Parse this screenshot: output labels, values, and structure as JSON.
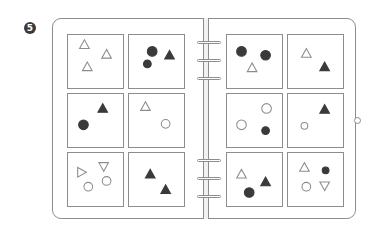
{
  "figure": {
    "number": "5",
    "stroke_color": "#8d8d8d",
    "fill_color": "#3a3a3a"
  },
  "spine_rings_y": [
    42,
    60,
    78,
    160,
    178,
    196
  ],
  "panels": [
    {
      "id": "L1",
      "x": 67,
      "y": 34,
      "shapes": [
        {
          "type": "triangle-up",
          "fill": false,
          "cx": 17,
          "cy": 10,
          "r": 5
        },
        {
          "type": "triangle-up",
          "fill": false,
          "cx": 40,
          "cy": 20,
          "r": 5
        },
        {
          "type": "triangle-up",
          "fill": false,
          "cx": 20,
          "cy": 33,
          "r": 5
        }
      ]
    },
    {
      "id": "L2",
      "x": 128,
      "y": 34,
      "shapes": [
        {
          "type": "circle",
          "fill": true,
          "cx": 24,
          "cy": 17,
          "r": 5
        },
        {
          "type": "circle",
          "fill": true,
          "cx": 19,
          "cy": 30,
          "r": 4
        },
        {
          "type": "triangle-up",
          "fill": true,
          "cx": 42,
          "cy": 21,
          "r": 5
        }
      ]
    },
    {
      "id": "L3",
      "x": 67,
      "y": 93,
      "shapes": [
        {
          "type": "triangle-up",
          "fill": true,
          "cx": 36,
          "cy": 15,
          "r": 5
        },
        {
          "type": "circle",
          "fill": true,
          "cx": 16,
          "cy": 32,
          "r": 5
        }
      ]
    },
    {
      "id": "L4",
      "x": 128,
      "y": 93,
      "shapes": [
        {
          "type": "triangle-up",
          "fill": false,
          "cx": 17,
          "cy": 13,
          "r": 5
        },
        {
          "type": "circle",
          "fill": false,
          "cx": 38,
          "cy": 31,
          "r": 4.5
        }
      ]
    },
    {
      "id": "L5",
      "x": 67,
      "y": 152,
      "shapes": [
        {
          "type": "triangle-right",
          "fill": false,
          "cx": 14,
          "cy": 20,
          "r": 5
        },
        {
          "type": "triangle-down",
          "fill": false,
          "cx": 37,
          "cy": 14,
          "r": 5
        },
        {
          "type": "circle",
          "fill": false,
          "cx": 40,
          "cy": 29,
          "r": 4.5
        },
        {
          "type": "circle",
          "fill": false,
          "cx": 21,
          "cy": 35,
          "r": 4.5
        }
      ]
    },
    {
      "id": "L6",
      "x": 128,
      "y": 152,
      "shapes": [
        {
          "type": "triangle-up",
          "fill": true,
          "cx": 22,
          "cy": 22,
          "r": 5
        },
        {
          "type": "triangle-up",
          "fill": true,
          "cx": 38,
          "cy": 38,
          "r": 5
        }
      ]
    },
    {
      "id": "R1",
      "x": 226,
      "y": 34,
      "shapes": [
        {
          "type": "circle",
          "fill": true,
          "cx": 15,
          "cy": 17,
          "r": 5
        },
        {
          "type": "circle",
          "fill": true,
          "cx": 40,
          "cy": 21,
          "r": 5
        },
        {
          "type": "triangle-up",
          "fill": false,
          "cx": 26,
          "cy": 34,
          "r": 5
        }
      ]
    },
    {
      "id": "R2",
      "x": 287,
      "y": 34,
      "shapes": [
        {
          "type": "triangle-up",
          "fill": false,
          "cx": 19,
          "cy": 19,
          "r": 5
        },
        {
          "type": "triangle-up",
          "fill": true,
          "cx": 38,
          "cy": 33,
          "r": 5
        }
      ]
    },
    {
      "id": "R3",
      "x": 226,
      "y": 93,
      "shapes": [
        {
          "type": "circle",
          "fill": false,
          "cx": 41,
          "cy": 15,
          "r": 5
        },
        {
          "type": "circle",
          "fill": false,
          "cx": 15,
          "cy": 32,
          "r": 5
        },
        {
          "type": "circle",
          "fill": true,
          "cx": 40,
          "cy": 38,
          "r": 4
        }
      ]
    },
    {
      "id": "R4",
      "x": 287,
      "y": 93,
      "shapes": [
        {
          "type": "triangle-up",
          "fill": true,
          "cx": 38,
          "cy": 16,
          "r": 5
        },
        {
          "type": "circle",
          "fill": false,
          "cx": 17,
          "cy": 33,
          "r": 3.5
        }
      ]
    },
    {
      "id": "R5",
      "x": 226,
      "y": 152,
      "shapes": [
        {
          "type": "triangle-up",
          "fill": false,
          "cx": 15,
          "cy": 22,
          "r": 5
        },
        {
          "type": "triangle-up",
          "fill": true,
          "cx": 40,
          "cy": 30,
          "r": 5
        },
        {
          "type": "circle",
          "fill": true,
          "cx": 23,
          "cy": 41,
          "r": 5
        }
      ]
    },
    {
      "id": "R6",
      "x": 287,
      "y": 152,
      "shapes": [
        {
          "type": "triangle-up",
          "fill": false,
          "cx": 17,
          "cy": 15,
          "r": 5
        },
        {
          "type": "circle",
          "fill": true,
          "cx": 39,
          "cy": 18,
          "r": 3.5
        },
        {
          "type": "circle",
          "fill": false,
          "cx": 19,
          "cy": 35,
          "r": 4.5
        },
        {
          "type": "triangle-down",
          "fill": false,
          "cx": 38,
          "cy": 34,
          "r": 5
        }
      ]
    }
  ]
}
